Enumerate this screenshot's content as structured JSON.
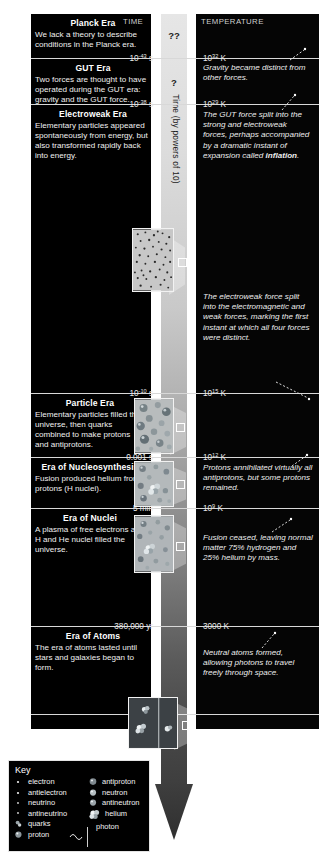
{
  "figure": {
    "headers": {
      "time": "TIME",
      "temperature": "TEMPERATURE"
    },
    "axis": {
      "label": "Time (by powers of 10)",
      "unknown_top": "??",
      "unknown_second": "?"
    },
    "colors": {
      "background": "#000000",
      "rule": "#d8d8d8",
      "axis_band_light": "#e6e6e6",
      "axis_band_dark": "#3e3e3e",
      "text": "#ffffff"
    }
  },
  "eras": [
    {
      "name": "Planck Era",
      "description": "We lack a theory to describe conditions in the Planck era."
    },
    {
      "name": "GUT Era",
      "description": "Two forces are thought to have operated during the GUT era: gravity and the GUT force."
    },
    {
      "name": "Electroweak Era",
      "description": "Elementary particles appeared spontaneously from energy, but also transformed rapidly back into energy."
    },
    {
      "name": "Particle Era",
      "description": "Elementary particles filled the universe, then quarks combined to make protons and antiprotons."
    },
    {
      "name": "Era of Nucleosynthesis",
      "description": "Fusion produced helium from protons (H nuclei)."
    },
    {
      "name": "Era of Nuclei",
      "description": "A plasma of free electrons and H and He nuclei filled the universe."
    },
    {
      "name": "Era of Atoms",
      "description": "The era of atoms lasted until stars and galaxies began to form."
    }
  ],
  "time_ticks": [
    {
      "base": "10",
      "exp": "-43",
      "unit": " s"
    },
    {
      "base": "10",
      "exp": "-38",
      "unit": " s"
    },
    {
      "base": "10",
      "exp": "-10",
      "unit": " s"
    },
    {
      "base": "0.001 s",
      "exp": "",
      "unit": ""
    },
    {
      "base": "5 min",
      "exp": "",
      "unit": ""
    },
    {
      "base": "380,000 yr",
      "exp": "",
      "unit": ""
    }
  ],
  "temp_ticks": [
    {
      "base": "10",
      "exp": "32",
      "unit": " K"
    },
    {
      "base": "10",
      "exp": "29",
      "unit": " K"
    },
    {
      "base": "10",
      "exp": "15",
      "unit": " K"
    },
    {
      "base": "10",
      "exp": "12",
      "unit": " K"
    },
    {
      "base": "10",
      "exp": "9",
      "unit": " K"
    },
    {
      "base": "3000 K",
      "exp": "",
      "unit": ""
    }
  ],
  "temp_notes": [
    {
      "text": "Gravity became distinct from other forces."
    },
    {
      "text": "The GUT force split into the strong and electroweak forces, perhaps accompanied by a dramatic instant of expansion called ",
      "emphasis": "inflation",
      "tail": "."
    },
    {
      "text": "The electroweak force split into the electromagnetic and weak forces, marking the first instant at which all four forces were distinct."
    },
    {
      "text": "Protons annihilated virtually all antiprotons, but some protons remained."
    },
    {
      "text": "Fusion ceased, leaving normal matter 75% hydrogen and 25% helium by mass."
    },
    {
      "text": "Neutral atoms formed, allowing photons to travel freely through space."
    }
  ],
  "key": {
    "title": "Key",
    "column_left": [
      {
        "label": "electron",
        "glyph": "dot-tiny"
      },
      {
        "label": "antielectron",
        "glyph": "dot-tiny"
      },
      {
        "label": "neutrino",
        "glyph": "dot-tiny"
      },
      {
        "label": "antineutrino",
        "glyph": "dot-tiny"
      },
      {
        "label": "quarks",
        "glyph": "quark-pair"
      },
      {
        "label": "proton",
        "glyph": "sphere-proton"
      }
    ],
    "column_right": [
      {
        "label": "antiproton",
        "glyph": "sphere-antiproton"
      },
      {
        "label": "neutron",
        "glyph": "sphere-neutron"
      },
      {
        "label": "antineutron",
        "glyph": "sphere-antineutron"
      },
      {
        "label": "helium",
        "glyph": "helium-cluster"
      },
      {
        "label": "photon",
        "glyph": "photon-wave"
      }
    ]
  }
}
